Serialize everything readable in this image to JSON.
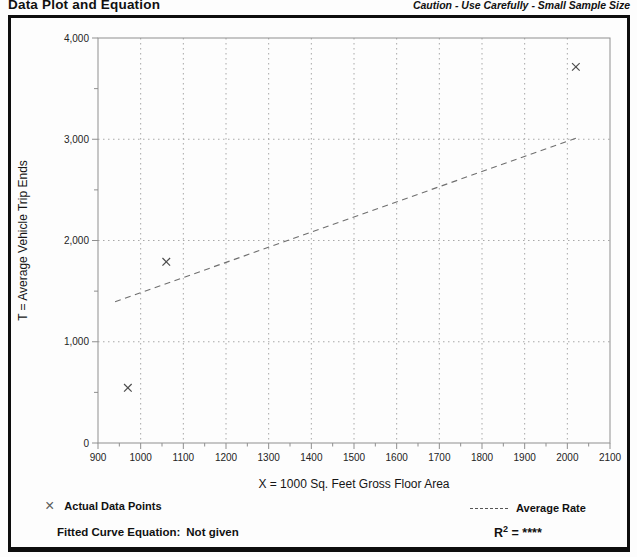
{
  "header": {
    "title": "Data Plot and Equation",
    "caution": "Caution - Use Carefully - Small Sample Size"
  },
  "legend": {
    "x_marker_symbol": "×",
    "actual_label": "Actual Data Points",
    "average_label": "Average Rate"
  },
  "footer": {
    "equation_label": "Fitted Curve Equation:",
    "equation_value": "Not given",
    "r2_base": "R",
    "r2_sup": "2",
    "r2_rest": "= ****"
  },
  "chart_data": {
    "type": "scatter",
    "title": "",
    "xlabel": "X = 1000 Sq. Feet Gross Floor Area",
    "ylabel": "T = Average Vehicle Trip Ends",
    "xlim": [
      900,
      2100
    ],
    "ylim": [
      0,
      4000
    ],
    "x_major_ticks": [
      900,
      1000,
      1100,
      1200,
      1300,
      1400,
      1500,
      1600,
      1700,
      1800,
      1900,
      2000,
      2100
    ],
    "x_minor_step": 50,
    "y_major_ticks": [
      0,
      1000,
      2000,
      3000,
      4000
    ],
    "y_minor_step": 500,
    "grid": "dotted at interior major ticks, both axes",
    "legend_position": "bottom",
    "series": [
      {
        "name": "Actual Data Points",
        "style": "x-marker",
        "points": [
          [
            970,
            545
          ],
          [
            1060,
            1790
          ],
          [
            2020,
            3715
          ]
        ]
      },
      {
        "name": "Average Rate",
        "style": "dashed-line",
        "points": [
          [
            940,
            1395
          ],
          [
            2020,
            3010
          ]
        ]
      }
    ]
  }
}
